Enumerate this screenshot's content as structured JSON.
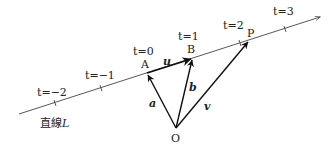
{
  "diagram": {
    "line": {
      "name": "直線L",
      "label_text": "直線",
      "label_var": "L",
      "start": [
        19,
        114
      ],
      "end": [
        320,
        17
      ]
    },
    "ticks": [
      {
        "t": -2,
        "label": "t=−2",
        "x": 55,
        "y": 103,
        "lx": 38,
        "ly": 95
      },
      {
        "t": -1,
        "label": "t=−1",
        "x": 101,
        "y": 88,
        "lx": 86,
        "ly": 78
      },
      {
        "t": 0,
        "label": "t=0",
        "x": 147,
        "y": 73,
        "lx": 133,
        "ly": 53
      },
      {
        "t": 1,
        "label": "t=1",
        "x": 193,
        "y": 58,
        "lx": 178,
        "ly": 39
      },
      {
        "t": 2,
        "label": "t=2",
        "x": 240,
        "y": 43,
        "lx": 223,
        "ly": 28
      },
      {
        "t": 3,
        "label": "t=3",
        "x": 285,
        "y": 29,
        "lx": 273,
        "ly": 14
      }
    ],
    "points": {
      "A": {
        "label": "A",
        "x": 147,
        "y": 73
      },
      "B": {
        "label": "B",
        "x": 193,
        "y": 58
      },
      "P": {
        "label": "P",
        "x": 249,
        "y": 40
      },
      "O": {
        "label": "O",
        "x": 176,
        "y": 128
      }
    },
    "vectors": {
      "a": {
        "label": "a",
        "from": "O",
        "to": "A"
      },
      "b": {
        "label": "b",
        "from": "O",
        "to": "B"
      },
      "v": {
        "label": "v",
        "from": "O",
        "to": "P"
      },
      "u": {
        "label": "u",
        "from": "A",
        "to": "B"
      }
    }
  },
  "labels": {
    "t_m2": "t=−2",
    "t_m1": "t=−1",
    "t_0": "t=0",
    "t_1": "t=1",
    "t_2": "t=2",
    "t_3": "t=3",
    "pt_A": "A",
    "pt_B": "B",
    "pt_P": "P",
    "pt_O": "O",
    "vec_a": "a",
    "vec_b": "b",
    "vec_v": "v",
    "vec_u": "u",
    "line_name_kanji": "直線",
    "line_name_var": "L"
  }
}
